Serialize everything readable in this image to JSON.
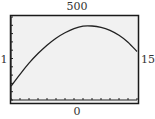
{
  "window": {
    "ymax_label": "500",
    "ymin_label": "0",
    "xmin_label": "1",
    "xmax_label": "15"
  },
  "colors": {
    "frame": "#1a1a1a",
    "plot_bg": "#f1f1f1",
    "curve": "#222222"
  },
  "chart_data": {
    "type": "line",
    "title": "",
    "xlabel": "",
    "ylabel": "",
    "xlim": [
      1,
      15
    ],
    "ylim": [
      0,
      500
    ],
    "grid": false,
    "legend": "none",
    "x_ticks_count": 15,
    "y_ticks_count": 10,
    "series": [
      {
        "name": "curve",
        "x": [
          1,
          2,
          3,
          4,
          5,
          6,
          7,
          8,
          9,
          10,
          11,
          12,
          13,
          14,
          15
        ],
        "values": [
          83,
          155,
          222,
          280,
          330,
          372,
          405,
          430,
          445,
          446,
          438,
          420,
          390,
          348,
          292
        ]
      }
    ]
  }
}
